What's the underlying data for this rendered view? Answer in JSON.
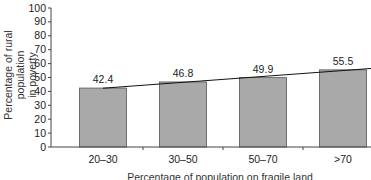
{
  "chart_data": {
    "type": "bar",
    "title": "",
    "categories": [
      "20–30",
      "30–50",
      "50–70",
      ">70"
    ],
    "values": [
      42.4,
      46.8,
      49.9,
      55.5
    ],
    "data_labels": [
      "42.4",
      "46.8",
      "49.9",
      "55.5"
    ],
    "trendline": true,
    "xlabel": "Percentage of population on fragile land",
    "ylabel": "Percentage of rural population in poverty",
    "ylabel_lines": [
      "Percentage of rural population",
      "in poverty"
    ],
    "ylim": [
      0,
      100
    ],
    "yticks": [
      0,
      10,
      20,
      30,
      40,
      50,
      60,
      70,
      80,
      90,
      100
    ],
    "grid": false,
    "legend": null,
    "bar_color": "#a9a9a9"
  }
}
